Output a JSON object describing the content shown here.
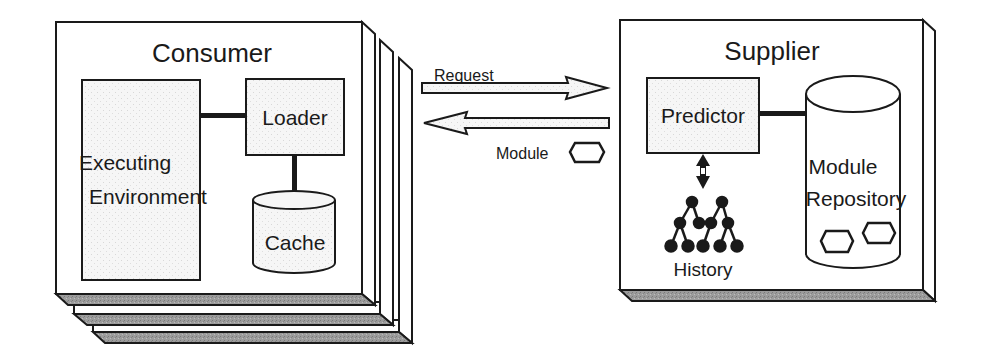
{
  "consumer": {
    "title": "Consumer",
    "executing_environment": [
      "Executing",
      "Environment"
    ],
    "loader": "Loader",
    "cache": "Cache",
    "stack_count": 3
  },
  "channel": {
    "request_label": "Request",
    "module_label": "Module",
    "module_icon": "hexagon-module-icon"
  },
  "supplier": {
    "title": "Supplier",
    "predictor": "Predictor",
    "history": "History",
    "history_icon": "tree-graph-icon",
    "repository": [
      "Module",
      "Repository"
    ],
    "stored_modules": 2
  },
  "colors": {
    "stroke": "#1a1a1a",
    "panel_fill": "#ffffff",
    "component_fill": "#f4f4f4",
    "base_fill": "#9a9a9a"
  }
}
